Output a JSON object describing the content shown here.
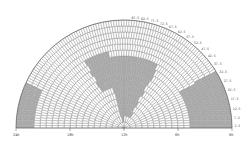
{
  "diagram": {
    "type": "polar-sky-coverage",
    "center": [
      124,
      128
    ],
    "radius": 108,
    "colors": {
      "grid": "#777777",
      "fill": "#ffffff",
      "shade": "#a8a8a8",
      "label": "#444444"
    },
    "x_axis_labels": [
      {
        "text": "24h",
        "frac": 0.0
      },
      {
        "text": "18h",
        "frac": 0.25
      },
      {
        "text": "12h",
        "frac": 0.5
      },
      {
        "text": "6h",
        "frac": 0.75
      },
      {
        "text": "0h",
        "frac": 1.0
      }
    ],
    "dec_labels": [
      "87.5",
      "82.5",
      "77.5",
      "72.5",
      "67.5",
      "62.5",
      "57.5",
      "52.5",
      "47.5",
      "42.5",
      "37.5",
      "32.5",
      "27.5",
      "22.5",
      "17.5",
      "12.5",
      "7.5",
      "2.5"
    ],
    "shaded_regions": [
      {
        "ring_from": 2,
        "ring_to": 12,
        "ang_from": 0.42,
        "ang_to": 0.66
      },
      {
        "ring_from": 7,
        "ring_to": 13,
        "ang_from": 0.33,
        "ang_to": 0.44
      },
      {
        "ring_from": 11,
        "ring_to": 18,
        "ang_from": 0.82,
        "ang_to": 1.0
      },
      {
        "ring_from": 15,
        "ring_to": 18,
        "ang_from": 0.0,
        "ang_to": 0.14
      },
      {
        "ring_from": 1,
        "ring_to": 3,
        "ang_from": 0.4,
        "ang_to": 0.47
      }
    ]
  }
}
